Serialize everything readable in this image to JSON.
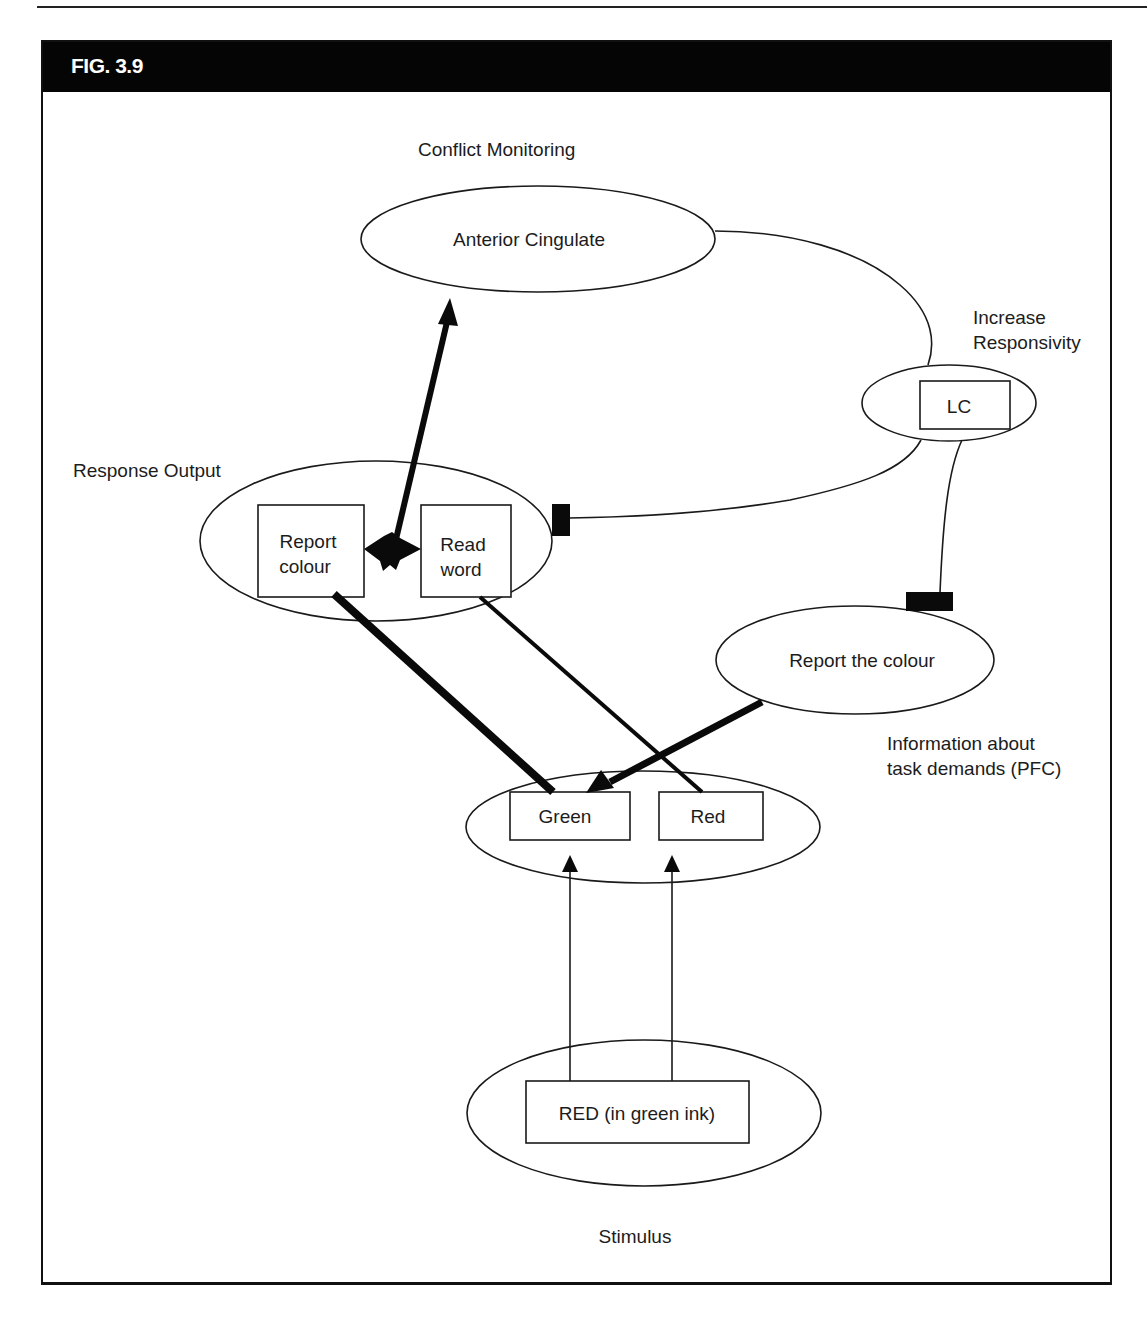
{
  "figure": {
    "title": "FIG. 3.9"
  },
  "labels": {
    "conflict_monitoring": "Conflict Monitoring",
    "anterior_cingulate": "Anterior Cingulate",
    "increase_responsivity_line1": "Increase",
    "increase_responsivity_line2": "Responsivity",
    "lc": "LC",
    "response_output": "Response Output",
    "report_colour_line1": "Report",
    "report_colour_line2": "colour",
    "read_word_line1": "Read",
    "read_word_line2": "word",
    "report_the_colour": "Report the colour",
    "task_demands_line1": "Information about",
    "task_demands_line2": "task demands (PFC)",
    "green": "Green",
    "red": "Red",
    "stimulus_box": "RED (in green ink)",
    "stimulus": "Stimulus"
  },
  "colors": {
    "header_bg": "#050505",
    "header_text": "#ffffff",
    "line": "#1a1a1a",
    "background": "#ffffff"
  }
}
